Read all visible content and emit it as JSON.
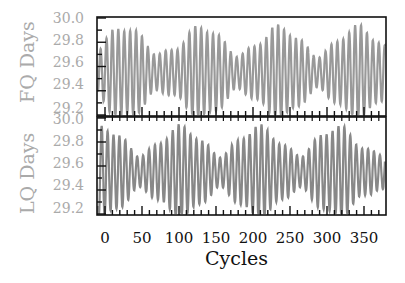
{
  "chart_data": [
    {
      "type": "line",
      "panel": "top",
      "ylabel": "FQ Days",
      "xlabel": "",
      "ylim": [
        29.2,
        30.0
      ],
      "yticks": [
        "30.0",
        "29.8",
        "29.6",
        "29.4",
        "29.2"
      ],
      "xlim": [
        0,
        380
      ],
      "line_color": "#999999",
      "description": "Oscillating series with period ~8 cycles between roughly 29.2 and 29.9 days, amplitude beating slowly",
      "series": [
        {
          "name": "FQ",
          "period_cycles": 8.0,
          "mean": 29.55,
          "amplitude_range": [
            0.15,
            0.38
          ]
        }
      ]
    },
    {
      "type": "line",
      "panel": "bottom",
      "ylabel": "LQ Days",
      "xlabel": "Cycles",
      "ylim": [
        29.2,
        30.0
      ],
      "yticks": [
        "30.0",
        "29.8",
        "29.6",
        "29.4",
        "29.2"
      ],
      "xticks": [
        "0",
        "50",
        "100",
        "150",
        "200",
        "250",
        "300",
        "350"
      ],
      "xlim": [
        0,
        380
      ],
      "line_color": "#888888",
      "description": "Oscillating series with period ~8 cycles between roughly 29.2 and 29.9 days, amplitude beating slowly",
      "series": [
        {
          "name": "LQ",
          "period_cycles": 8.0,
          "mean": 29.55,
          "amplitude_range": [
            0.15,
            0.38
          ]
        }
      ]
    }
  ],
  "labels": {
    "top_ylabel": "FQ Days",
    "bottom_ylabel": "LQ Days",
    "xlabel": "Cycles",
    "yticks": [
      "30.0",
      "29.8",
      "29.6",
      "29.4",
      "29.2"
    ],
    "xticks": [
      "0",
      "50",
      "100",
      "150",
      "200",
      "250",
      "300",
      "350"
    ]
  }
}
